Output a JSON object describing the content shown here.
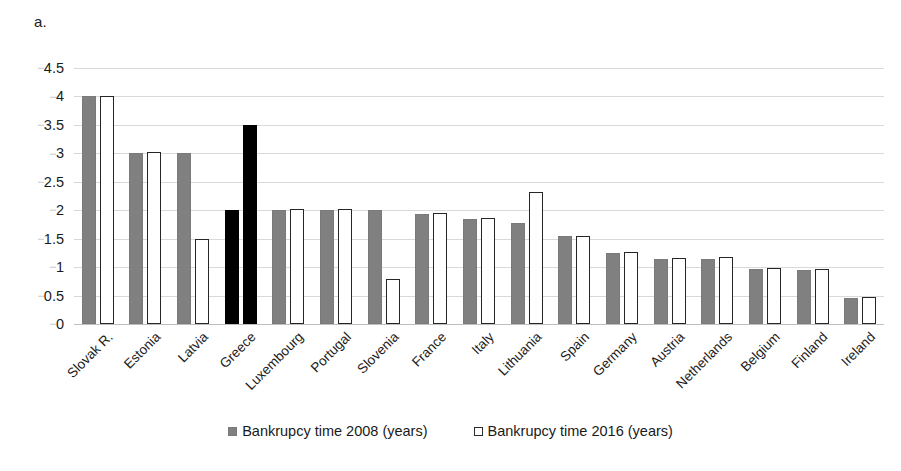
{
  "panel": {
    "letter": "a."
  },
  "legend": [
    {
      "label": "Bankrupcy time 2008 (years)",
      "swatch": "filled-gray-square",
      "color": "#808080"
    },
    {
      "label": "Bankrupcy time 2016 (years)",
      "swatch": "hollow-white-square",
      "color": "#ffffff"
    }
  ],
  "chart_data": {
    "type": "bar",
    "title": "",
    "subtitle": "",
    "xlabel": "",
    "ylabel": "",
    "ylim": [
      0,
      4.5
    ],
    "yticks": [
      "0",
      "0.5",
      "1",
      "1.5",
      "2",
      "2.5",
      "3",
      "3.5",
      "4",
      "4.5"
    ],
    "ytick_values": [
      0,
      0.5,
      1,
      1.5,
      2,
      2.5,
      3,
      3.5,
      4,
      4.5
    ],
    "grid": true,
    "legend_position": "bottom-center",
    "highlight_category": "Greece",
    "highlight_color": "#000000",
    "series_colors": {
      "Bankrupcy time 2008 (years)": "#808080",
      "Bankrupcy time 2016 (years)": "#ffffff"
    },
    "categories": [
      "Slovak R.",
      "Estonia",
      "Latvia",
      "Greece",
      "Luxembourg",
      "Portugal",
      "Slovenia",
      "France",
      "Italy",
      "Lithuania",
      "Spain",
      "Germany",
      "Austria",
      "Netherlands",
      "Belgium",
      "Finland",
      "Ireland"
    ],
    "series": [
      {
        "name": "Bankrupcy time 2008 (years)",
        "values": [
          4.0,
          3.0,
          3.0,
          2.0,
          2.0,
          2.0,
          2.0,
          1.93,
          1.85,
          1.77,
          1.54,
          1.24,
          1.15,
          1.15,
          0.97,
          0.95,
          0.45
        ]
      },
      {
        "name": "Bankrupcy time 2016 (years)",
        "values": [
          4.0,
          3.02,
          1.5,
          3.5,
          2.02,
          2.03,
          0.8,
          1.95,
          1.87,
          2.32,
          1.55,
          1.26,
          1.16,
          1.17,
          0.98,
          0.97,
          0.47
        ]
      }
    ]
  }
}
